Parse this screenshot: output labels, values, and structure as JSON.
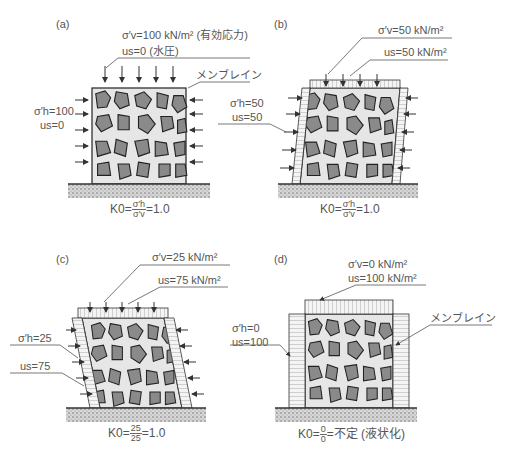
{
  "panels": {
    "a": {
      "tag": "(a)",
      "sigma_v": "σ′v=100 kN/m² (有効応力)",
      "u_top": "us=0 (水圧)",
      "membrane": "メンブレイン",
      "sigma_h": "σ′h=100",
      "u_side": "us=0",
      "k0_prefix": "K0=",
      "k0_num": "σ′h",
      "k0_den": "σ′v",
      "k0_result": "=1.0"
    },
    "b": {
      "tag": "(b)",
      "sigma_v": "σ′v=50 kN/m²",
      "u_top": "us=50 kN/m²",
      "sigma_h": "σ′h=50",
      "u_side": "us=50",
      "k0_prefix": "K0=",
      "k0_num": "σ′h",
      "k0_den": "σ′v",
      "k0_result": "=1.0"
    },
    "c": {
      "tag": "(c)",
      "sigma_v": "σ′v=25 kN/m²",
      "u_top": "us=75 kN/m²",
      "sigma_h": "σ′h=25",
      "u_side": "us=75",
      "k0_prefix": "K0=",
      "k0_num": "25",
      "k0_den": "25",
      "k0_result": "=1.0"
    },
    "d": {
      "tag": "(d)",
      "sigma_v": "σ′v=0 kN/m²",
      "u_top": "us=100 kN/m²",
      "membrane": "メンブレイン",
      "sigma_h": "σ′h=0",
      "u_side": "us=100",
      "k0_prefix": "K0=",
      "k0_num": "0",
      "k0_den": "0",
      "k0_result": "=不定 (液状化)"
    }
  },
  "colors": {
    "grain": "#8a8a8a",
    "grain_outline": "#222222",
    "pore": "#e6e6e6",
    "ground": "#c8c8c8",
    "text": "#555555"
  }
}
